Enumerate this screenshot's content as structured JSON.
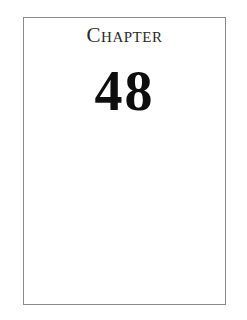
{
  "page": {
    "heading": "Chapter",
    "number": "48"
  },
  "colors": {
    "border": "#8a8a8a",
    "text": "#0e0e0e",
    "background": "#ffffff"
  }
}
